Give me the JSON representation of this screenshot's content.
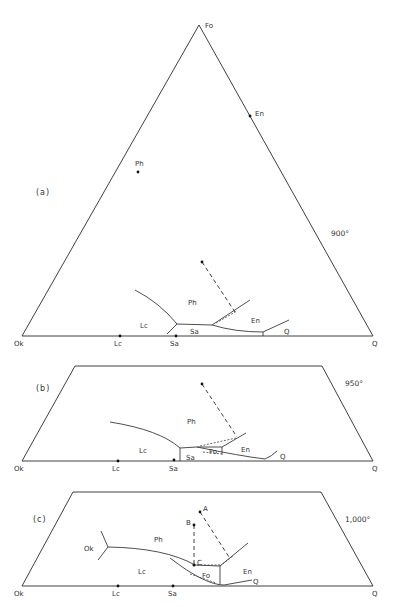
{
  "figure": {
    "panels": [
      {
        "id": "a",
        "label": "(a)",
        "temperature": "900°",
        "corners": {
          "Fo": "Fo",
          "Ok": "Ok",
          "Q": "Q"
        },
        "compositions": {
          "En": "En",
          "Ph": "Ph",
          "Lc": "Lc",
          "Sa": "Sa"
        },
        "fields": {
          "Ph": "Ph",
          "Lc": "Lc",
          "Sa": "Sa",
          "En": "En",
          "Q": "Q"
        }
      },
      {
        "id": "b",
        "label": "(b)",
        "temperature": "950°",
        "corners": {
          "Ok": "Ok",
          "Q": "Q"
        },
        "compositions": {
          "Lc": "Lc",
          "Sa": "Sa"
        },
        "fields": {
          "Ph": "Ph",
          "Lc": "Lc",
          "Sa": "Sa",
          "Fo": "Fo",
          "En": "En",
          "Q": "Q"
        }
      },
      {
        "id": "c",
        "label": "(c)",
        "temperature": "1,000°",
        "corners": {
          "Ok": "Ok",
          "Q": "Q"
        },
        "compositions": {
          "Lc": "Lc",
          "Sa": "Sa"
        },
        "fields": {
          "Ok": "Ok",
          "Ph": "Ph",
          "Lc": "Lc",
          "Fo": "Fo",
          "En": "En",
          "Q": "Q"
        },
        "points": {
          "A": "A",
          "B": "B",
          "C": "C"
        }
      }
    ]
  }
}
